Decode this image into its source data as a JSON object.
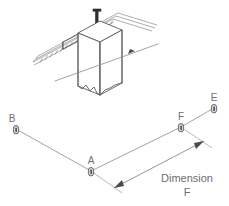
{
  "drawing": {
    "title": "Rail mount column layout with dimension callout",
    "background_color": "#ffffff",
    "line_color": "#8a8a90",
    "label_color": "#6e6e73",
    "marker_fill": "#d8d8dc",
    "marker_stroke": "#4a4a50"
  },
  "isometric": {
    "name": "rail-and-column-assembly",
    "parts": {
      "column_label": "column",
      "rail_label": "hatched-rail-beam",
      "bracket_label": "mounting-bracket",
      "post_label": "vertical-post",
      "centerline_label": "centerline-with-arrow"
    }
  },
  "points": [
    {
      "id": "B",
      "label": "B",
      "x": 16,
      "y": 129,
      "label_x": 12,
      "label_y": 122
    },
    {
      "id": "A",
      "label": "A",
      "x": 91,
      "y": 171,
      "label_x": 88,
      "label_y": 164
    },
    {
      "id": "F",
      "label": "F",
      "x": 181,
      "y": 127,
      "label_x": 178,
      "label_y": 120
    },
    {
      "id": "E",
      "label": "E",
      "x": 214,
      "y": 108,
      "label_x": 211,
      "label_y": 101
    }
  ],
  "segments": [
    {
      "name": "segment-b-a",
      "from": "B",
      "to": "A"
    },
    {
      "name": "segment-a-f",
      "from": "A",
      "to": "F"
    },
    {
      "name": "segment-f-e",
      "from": "F",
      "to": "E"
    }
  ],
  "dimension": {
    "name": "dimension-f",
    "line_1": "Dimension",
    "line_2": "F",
    "text_x": 187,
    "text_y": 182,
    "arrow_start_x": 114,
    "arrow_start_y": 188,
    "arrow_end_x": 204,
    "arrow_end_y": 141,
    "extension_from": "A",
    "extension_to": "F"
  }
}
